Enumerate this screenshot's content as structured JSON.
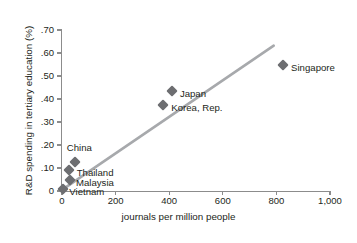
{
  "chart_data": {
    "type": "scatter",
    "title": "",
    "xlabel": "journals per million people",
    "ylabel": "R&D spending in tertiary education (%)",
    "xlim": [
      0,
      1000
    ],
    "ylim": [
      0,
      0.7
    ],
    "xticks": [
      0,
      200,
      400,
      600,
      800,
      1000
    ],
    "xtick_labels": [
      "0",
      "200",
      "400",
      "600",
      "800",
      "1,000"
    ],
    "yticks": [
      0,
      0.1,
      0.2,
      0.3,
      0.4,
      0.5,
      0.6,
      0.7
    ],
    "ytick_labels": [
      "0",
      ".10",
      ".20",
      ".30",
      ".40",
      ".50",
      ".60",
      ".70"
    ],
    "grid": false,
    "legend": "none",
    "marker": "diamond",
    "marker_color": "#6d6e71",
    "trendline": {
      "color": "#a7a9ac",
      "x_start": 0,
      "y_start": 0.005,
      "x_end": 790,
      "y_end": 0.632
    },
    "points": [
      {
        "label": "Vietnam",
        "x": 5,
        "y": 0.008,
        "label_dx": 6,
        "label_dy": 3
      },
      {
        "label": "Malaysia",
        "x": 30,
        "y": 0.048,
        "label_dx": 6,
        "label_dy": 3
      },
      {
        "label": "Thailand",
        "x": 25,
        "y": 0.09,
        "label_dx": 8,
        "label_dy": 3
      },
      {
        "label": "China",
        "x": 48,
        "y": 0.125,
        "label_dx": -8,
        "label_dy": -14
      },
      {
        "label": "Korea, Rep.",
        "x": 378,
        "y": 0.373,
        "label_dx": 8,
        "label_dy": 3
      },
      {
        "label": "Japan",
        "x": 410,
        "y": 0.435,
        "label_dx": 8,
        "label_dy": 3
      },
      {
        "label": "Singapore",
        "x": 825,
        "y": 0.55,
        "label_dx": 8,
        "label_dy": 3
      }
    ]
  }
}
